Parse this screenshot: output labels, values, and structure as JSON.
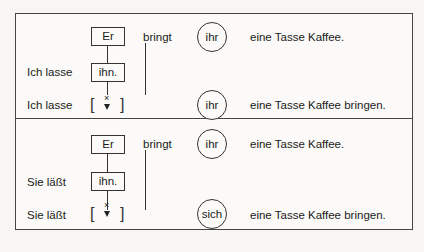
{
  "panels": [
    {
      "row1": {
        "subject": "Er",
        "verb": "bringt",
        "pronoun": "ihr",
        "object": "eine Tasse Kaffee."
      },
      "row2": {
        "prefix": "Ich lasse",
        "box": "ihn."
      },
      "row3": {
        "prefix": "Ich lasse",
        "gap_open": "[",
        "gap_close": "]",
        "deleted_mark": "×",
        "pronoun": "ihr",
        "object": "eine Tasse Kaffee bringen."
      }
    },
    {
      "row1": {
        "subject": "Er",
        "verb": "bringt",
        "pronoun": "ihr",
        "object": "eine Tasse Kaffee."
      },
      "row2": {
        "prefix": "Sie läßt",
        "box": "ihn."
      },
      "row3": {
        "prefix": "Sie läßt",
        "gap_open": "[",
        "gap_close": "]",
        "deleted_mark": "×",
        "pronoun": "sich",
        "object": "eine Tasse Kaffee bringen."
      }
    }
  ]
}
